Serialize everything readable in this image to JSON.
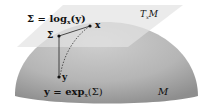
{
  "diagram": {
    "labels": {
      "log_map": "Σ = log",
      "log_sub": "x",
      "log_arg": "(y)",
      "exp_map": "y = exp",
      "exp_sub": "x",
      "exp_arg": "(Σ)",
      "point_x": "x",
      "point_sigma": "Σ",
      "point_y": "y",
      "tangent_space": "T",
      "tangent_sub": "x",
      "tangent_M": "M",
      "manifold": "M"
    },
    "colors": {
      "background": "#ffffff",
      "manifold_light": "#c8c8c8",
      "manifold_dark": "#9a9a9a",
      "plane": "#d9d9d9",
      "ink": "#111111"
    }
  }
}
